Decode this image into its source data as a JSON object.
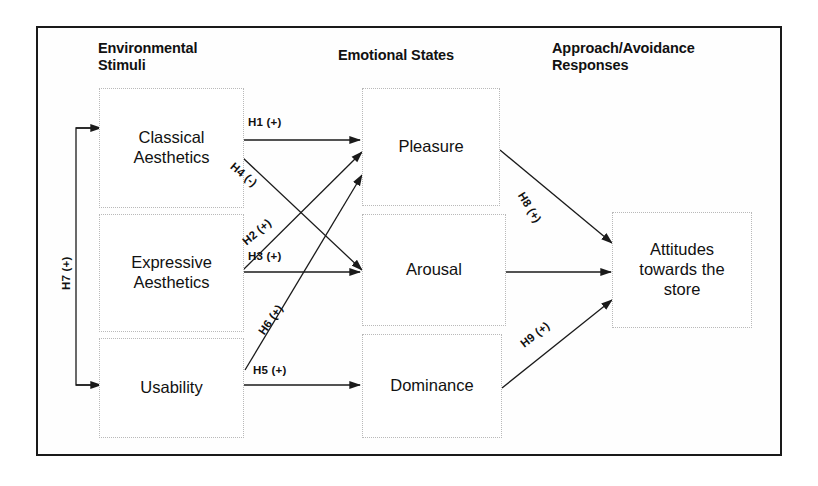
{
  "diagram": {
    "column_titles": [
      {
        "id": "environmental-stimuli",
        "label": "Environmental\nStimuli"
      },
      {
        "id": "emotional-states",
        "label": "Emotional States"
      },
      {
        "id": "approach-avoidance",
        "label": "Approach/Avoidance\nResponses"
      }
    ],
    "nodes": [
      {
        "id": "classical-aesthetics",
        "label": "Classical\nAesthetics"
      },
      {
        "id": "expressive-aesthetics",
        "label": "Expressive\nAesthetics"
      },
      {
        "id": "usability",
        "label": "Usability"
      },
      {
        "id": "pleasure",
        "label": "Pleasure"
      },
      {
        "id": "arousal",
        "label": "Arousal"
      },
      {
        "id": "dominance",
        "label": "Dominance"
      },
      {
        "id": "attitudes",
        "label": "Attitudes\ntowards the\nstore"
      }
    ],
    "edges": [
      {
        "id": "h1",
        "label": "H1 (+)",
        "from": "classical-aesthetics",
        "to": "pleasure",
        "sign": "+"
      },
      {
        "id": "h4",
        "label": "H4 (-)",
        "from": "classical-aesthetics",
        "to": "arousal",
        "sign": "-"
      },
      {
        "id": "h2",
        "label": "H2 (+)",
        "from": "expressive-aesthetics",
        "to": "pleasure",
        "sign": "+"
      },
      {
        "id": "h3",
        "label": "H3 (+)",
        "from": "expressive-aesthetics",
        "to": "arousal",
        "sign": "+"
      },
      {
        "id": "h5",
        "label": "H5 (+)",
        "from": "usability",
        "to": "dominance",
        "sign": "+"
      },
      {
        "id": "h6",
        "label": "H6 (+)",
        "from": "usability",
        "to": "pleasure",
        "sign": "+"
      },
      {
        "id": "h7",
        "label": "H7 (+)",
        "from": "classical-aesthetics",
        "to": "usability",
        "sign": "+"
      },
      {
        "id": "h8",
        "label": "H8 (+)",
        "from": "pleasure",
        "to": "attitudes",
        "sign": "+"
      },
      {
        "id": "h9",
        "label": "H9 (+)",
        "from": "dominance",
        "to": "attitudes",
        "sign": "+"
      },
      {
        "id": "arousal-attitudes",
        "label": "",
        "from": "arousal",
        "to": "attitudes",
        "sign": ""
      }
    ],
    "colors": {
      "frame_border": "#1a1a1a",
      "node_border": "#b9b9b9",
      "edge_stroke": "#1a1a1a",
      "text": "#111111",
      "background": "#ffffff"
    }
  }
}
